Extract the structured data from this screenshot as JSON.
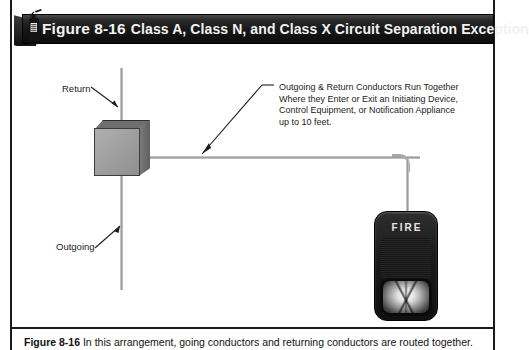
{
  "header": {
    "icon": "fire-extinguisher-icon",
    "figure_number": "Figure 8-16",
    "title": "Class A, Class N, and Class X Circuit Separation Exception",
    "bar_color": "#141414",
    "text_color": "#f2f2f2"
  },
  "diagram": {
    "labels": {
      "return": "Return",
      "outgoing": "Outgoing"
    },
    "callout": [
      "Outgoing & Return Conductors Run Together",
      "Where they Enter or Exit an Initiating Device,",
      "Control Equipment, or Notification Appliance",
      "up to 10 feet."
    ],
    "junction_box": "junction-box",
    "appliance": {
      "label": "FIRE",
      "type": "horn-strobe-notification-appliance"
    },
    "conductor_color": "#9e9e9e"
  },
  "caption": {
    "figure_number": "Figure 8-16",
    "text": "In this arrangement, going conductors and returning conductors are routed together."
  }
}
